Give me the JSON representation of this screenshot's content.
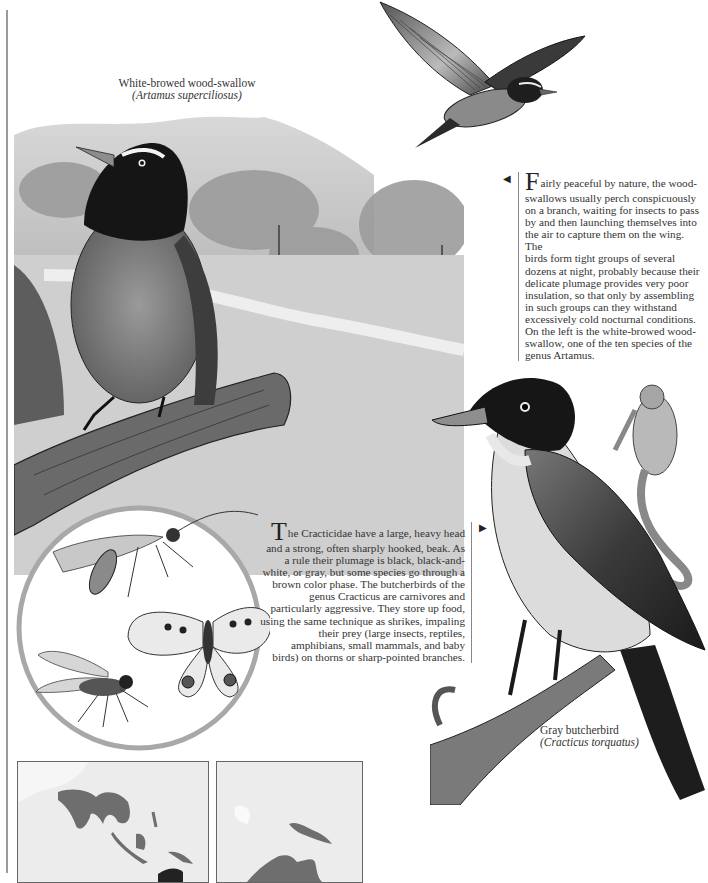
{
  "page": {
    "background": "#ffffff",
    "rule_color": "#9a9a9a"
  },
  "captions": {
    "wood_swallow": {
      "common_name": "White-browed wood-swallow",
      "scientific_name": "(Artamus superciliosus)"
    },
    "butcherbird": {
      "common_name": "Gray butcherbird",
      "scientific_name": "(Cracticus torquatus)"
    }
  },
  "paragraphs": {
    "wood_swallows": {
      "arrow": "◀",
      "dropcap": "F",
      "lines": [
        "airly peaceful by nature, the wood-",
        "swallows usually perch conspicuously",
        "on a branch, waiting for insects to pass",
        "by and then launching themselves into",
        "the air to capture them on the wing. The",
        "birds form tight groups of several",
        "dozens at night, probably because their",
        "delicate plumage provides very poor",
        "insulation, so that only by assembling",
        "in such groups can they withstand",
        "excessively cold nocturnal conditions.",
        "On the left is the white-browed wood-",
        "swallow, one of the ten species of the",
        "genus Artamus."
      ]
    },
    "cracticidae": {
      "arrow": "▶",
      "dropcap": "T",
      "lines": [
        "he Cracticidae have a large, heavy head",
        "and a strong, often sharply hooked, beak. As",
        "a rule their plumage is black, black-and-",
        "white, or gray, but some species go through a",
        "brown color phase. The butcherbirds of the",
        "genus Cracticus are carnivores and",
        "particularly aggressive. They store up food,",
        "using the same technique as shrikes, impaling",
        "their prey (large insects, reptiles,",
        "amphibians, small mammals, and baby",
        "birds) on thorns or sharp-pointed branches."
      ]
    }
  },
  "illustrations": {
    "landscape": "white-browed wood-swallow perched on log in landscape",
    "flying_bird": "wood-swallow in flight",
    "insects": "insects in circle: sawfly, butterfly, fly",
    "butcherbird": "gray butcherbird on branch with impaled frog"
  },
  "maps": {
    "left": {
      "region": "South & Southeast Asia distribution",
      "range_color": "#6e6e6e",
      "sea_color": "#ececec"
    },
    "right": {
      "region": "New Guinea & Australia distribution",
      "range_color": "#6e6e6e",
      "sea_color": "#ececec"
    }
  }
}
